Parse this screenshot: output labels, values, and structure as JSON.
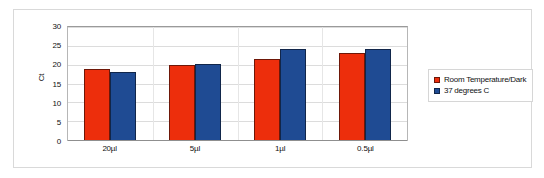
{
  "chart_data": {
    "type": "bar",
    "title": "",
    "subtitle": "",
    "xlabel": "",
    "ylabel": "Ct",
    "categories": [
      "20µl",
      "5µl",
      "1µl",
      "0.5µl"
    ],
    "series": [
      {
        "name": "Room Temperature/Dark",
        "color": "#ED2E0C",
        "values": [
          18.9,
          19.9,
          21.6,
          23.2
        ]
      },
      {
        "name": "37 degrees C",
        "color": "#1F4B93",
        "values": [
          18.1,
          20.3,
          24.1,
          24.2
        ]
      }
    ],
    "ylim": [
      0,
      30
    ],
    "yticks": [
      0,
      5,
      10,
      15,
      20,
      25,
      30
    ],
    "ytick_labels": [
      "0",
      "5",
      "10",
      "15",
      "20",
      "25",
      "30"
    ],
    "grid": true,
    "grid_axis": "y",
    "legend_position": "right",
    "plot_background": "#ffffff",
    "grid_color": "#dcdcdc",
    "axis_color": "#8f8f8f"
  },
  "legend": {
    "items": [
      {
        "label": "Room Temperature/Dark",
        "color": "#ED2E0C"
      },
      {
        "label": "37 degrees C",
        "color": "#1F4B93"
      }
    ]
  }
}
